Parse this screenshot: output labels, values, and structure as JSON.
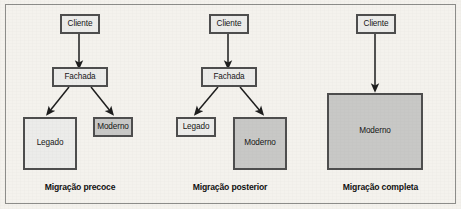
{
  "figure": {
    "background_color": "#f4f2ed",
    "frame_color": "#8d8d8a",
    "node_border_color": "#4e4e4e",
    "legacy_fill_color": "#ececea",
    "modern_fill_color": "#c8c8c6",
    "arrow_color": "#1d1d1d"
  },
  "panels": [
    {
      "id": "migracao-precoce",
      "caption": "Migração precoce",
      "nodes": {
        "client": "Cliente",
        "facade": "Fachada",
        "legacy": "Legado",
        "modern": "Moderno"
      }
    },
    {
      "id": "migracao-posterior",
      "caption": "Migração posterior",
      "nodes": {
        "client": "Cliente",
        "facade": "Fachada",
        "legacy": "Legado",
        "modern": "Moderno"
      }
    },
    {
      "id": "migracao-completa",
      "caption": "Migração completa",
      "nodes": {
        "client": "Cliente",
        "modern": "Moderno"
      }
    }
  ]
}
